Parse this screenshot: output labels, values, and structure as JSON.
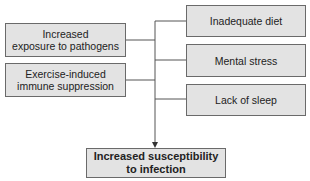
{
  "diagram": {
    "left_factors": [
      {
        "label_line1": "Increased",
        "label_line2": "exposure to pathogens"
      },
      {
        "label_line1": "Exercise-induced",
        "label_line2": "immune suppression"
      }
    ],
    "right_factors": [
      {
        "label": "Inadequate diet"
      },
      {
        "label": "Mental stress"
      },
      {
        "label": "Lack of sleep"
      }
    ],
    "outcome": {
      "label_line1": "Increased susceptibility",
      "label_line2": "to infection"
    },
    "colors": {
      "box_fill": "#e3e3e3",
      "box_border": "#6a6a6a",
      "connector": "#555555"
    }
  }
}
